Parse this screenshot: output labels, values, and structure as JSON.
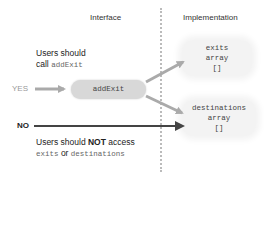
{
  "headers": {
    "interface": "Interface",
    "implementation": "Implementation"
  },
  "yes_note": {
    "line1": "Users should",
    "line2_prefix": "call ",
    "line2_code": "addExit"
  },
  "no_note": {
    "line1_prefix": "Users should ",
    "line1_bold": "NOT",
    "line1_suffix": " access",
    "line2_code_a": "exits",
    "line2_mid": " or ",
    "line2_code_b": "destinations"
  },
  "labels": {
    "yes": "YES",
    "no": "NO"
  },
  "method_box": {
    "label": "addExit"
  },
  "impl_boxes": [
    {
      "name": "exits",
      "type": "array",
      "value": "[]"
    },
    {
      "name": "destinations",
      "type": "array",
      "value": "[]"
    }
  ],
  "colors": {
    "pill": "#d8d8d8",
    "blob": "#f3f3f3",
    "arrow_light": "#aaaaaa",
    "arrow_dark": "#444444",
    "divider": "#bbbbbb"
  }
}
